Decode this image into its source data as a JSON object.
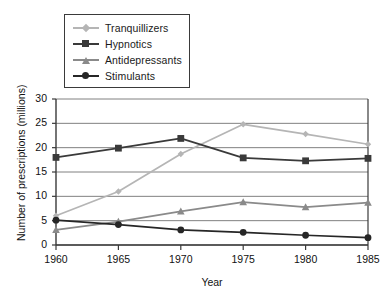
{
  "chart_data": {
    "type": "line",
    "title": "",
    "xlabel": "Year",
    "ylabel": "Number of prescriptions (millions)",
    "categories": [
      "1960",
      "1965",
      "1970",
      "1975",
      "1980",
      "1985"
    ],
    "x": [
      1960,
      1965,
      1970,
      1975,
      1980,
      1985
    ],
    "xlim": [
      1960,
      1985
    ],
    "ylim": [
      0,
      30
    ],
    "yticks": [
      "0",
      "5",
      "10",
      "15",
      "20",
      "25",
      "30"
    ],
    "ytick_values": [
      0,
      5,
      10,
      15,
      20,
      25,
      30
    ],
    "xticks": [
      "1960",
      "1965",
      "1970",
      "1975",
      "1980",
      "1985"
    ],
    "grid": "horizontal",
    "legend_position": "upper-left-outside",
    "series": [
      {
        "name": "Tranquillizers",
        "marker": "diamond",
        "color": "#b5b5b5",
        "values": [
          6.0,
          11.0,
          18.7,
          24.8,
          22.8,
          20.7
        ]
      },
      {
        "name": "Hypnotics",
        "marker": "square",
        "color": "#3a3a3a",
        "values": [
          18.0,
          19.9,
          21.9,
          17.9,
          17.3,
          17.8
        ]
      },
      {
        "name": "Antidepressants",
        "marker": "triangle",
        "color": "#8a8a8a",
        "values": [
          3.1,
          4.8,
          6.9,
          8.8,
          7.8,
          8.7
        ]
      },
      {
        "name": "Stimulants",
        "marker": "circle",
        "color": "#262626",
        "values": [
          5.1,
          4.2,
          3.1,
          2.6,
          2.0,
          1.5
        ]
      }
    ]
  },
  "legend": {
    "items": [
      {
        "label": "Tranquillizers"
      },
      {
        "label": "Hypnotics"
      },
      {
        "label": "Antidepressants"
      },
      {
        "label": "Stimulants"
      }
    ]
  },
  "axes": {
    "x_title": "Year",
    "y_title": "Number of prescriptions (millions)",
    "y_tick_labels": [
      "30",
      "25",
      "20",
      "15",
      "10",
      "5",
      "0"
    ],
    "x_tick_labels": [
      "1960",
      "1965",
      "1970",
      "1975",
      "1980",
      "1985"
    ]
  },
  "colors": {
    "axis": "#3a3a3a",
    "grid": "#808080",
    "background": "#ffffff",
    "tranquillizers": "#b5b5b5",
    "hypnotics": "#3a3a3a",
    "antidepressants": "#8a8a8a",
    "stimulants": "#262626"
  }
}
